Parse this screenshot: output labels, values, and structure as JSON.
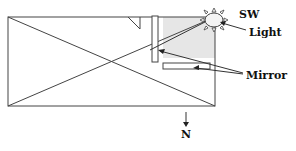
{
  "diagram": {
    "labels": {
      "direction_top": "SW",
      "light": "Light",
      "mirror": "Mirror",
      "direction_bottom": "N"
    },
    "colors": {
      "stroke": "#333333",
      "shade": "#e6e6e6",
      "text": "#111111"
    },
    "elements": [
      "room-rectangle",
      "diagonal-cross",
      "shaded-light-region",
      "vertical-mirror",
      "horizontal-mirror",
      "sun-icon",
      "light-ray",
      "mirror-pointer-arrows",
      "north-arrow"
    ]
  }
}
